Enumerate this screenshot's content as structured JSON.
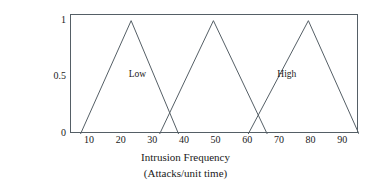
{
  "chart_data": {
    "type": "line",
    "title": "",
    "subtitle": "",
    "xlabel": "Intrusion Frequency",
    "xlabel_sub": "(Attacks/unit time)",
    "ylabel": "Membership",
    "ylabel_sub": "Function",
    "xlim": [
      4,
      95
    ],
    "ylim": [
      0,
      1.05
    ],
    "xticks": [
      10,
      20,
      30,
      40,
      50,
      60,
      70,
      80,
      90
    ],
    "xtick_labels": [
      "10",
      "20",
      "30",
      "40",
      "50",
      "60",
      "70",
      "80",
      "90"
    ],
    "yticks": [
      0,
      0.5,
      1
    ],
    "ytick_labels": [
      "0",
      "0.5",
      "1"
    ],
    "grid": false,
    "legend_position": "inline-annotation",
    "line_color": "#555f66",
    "frame_color": "#555f66",
    "background": "#ffffff",
    "series": [
      {
        "name": "Low",
        "x": [
          7,
          23,
          38
        ],
        "values": [
          0,
          1,
          0
        ],
        "shape": "triangular"
      },
      {
        "name": "Medium",
        "x": [
          32,
          49,
          66
        ],
        "values": [
          0,
          1,
          0
        ],
        "shape": "triangular"
      },
      {
        "name": "High",
        "x": [
          60,
          79,
          95
        ],
        "values": [
          0,
          1,
          0
        ],
        "shape": "triangular"
      }
    ],
    "annotations": [
      {
        "text": "Low",
        "x": 26,
        "y": 0.52
      },
      {
        "text": "High",
        "x": 73,
        "y": 0.52
      }
    ]
  }
}
